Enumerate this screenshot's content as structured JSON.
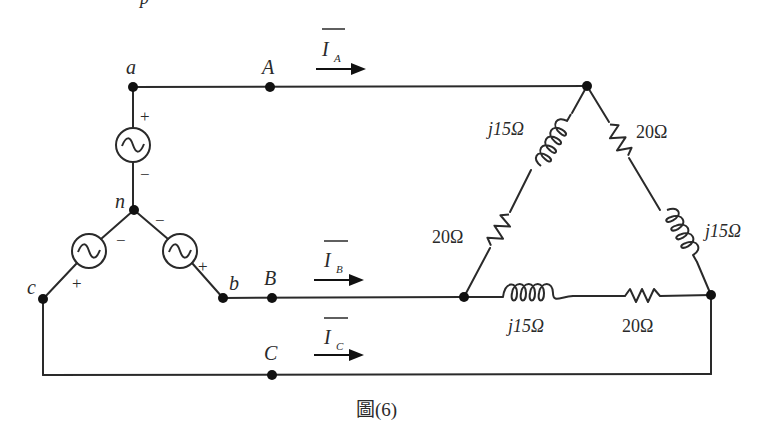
{
  "figure": {
    "caption": "圖(6)",
    "top_fragment": "p"
  },
  "nodes": {
    "a": "a",
    "A": "A",
    "n": "n",
    "b": "b",
    "B": "B",
    "c": "c",
    "C": "C"
  },
  "currents": {
    "IA": {
      "base": "I",
      "sub": "A"
    },
    "IB": {
      "base": "I",
      "sub": "B"
    },
    "IC": {
      "base": "I",
      "sub": "C"
    }
  },
  "sources": {
    "a": {
      "plus": "+",
      "minus": "−"
    },
    "b": {
      "plus": "+",
      "minus": "−"
    },
    "c": {
      "plus": "+",
      "minus": "−"
    }
  },
  "load": {
    "type": "delta",
    "branch_AB": {
      "inductor": "j15Ω",
      "resistor": "20Ω"
    },
    "branch_AC": {
      "resistor": "20Ω",
      "inductor": "j15Ω"
    },
    "branch_BC": {
      "inductor": "j15Ω",
      "resistor": "20Ω"
    }
  }
}
